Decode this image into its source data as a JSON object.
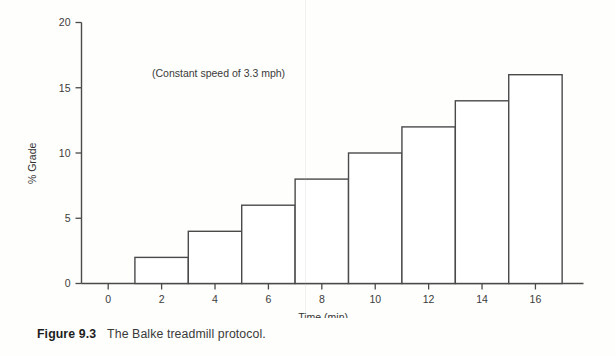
{
  "figure": {
    "caption_label": "Figure 9.3",
    "caption_text": "The Balke treadmill protocol."
  },
  "chart_data": {
    "type": "bar",
    "title": "",
    "subtitle": "",
    "annotation": "(Constant speed of 3.3 mph)",
    "xlabel": "Time (min)",
    "ylabel": "% Grade",
    "categories": [
      "2",
      "4",
      "6",
      "8",
      "10",
      "12",
      "14",
      "16"
    ],
    "x": [
      2,
      4,
      6,
      8,
      10,
      12,
      14,
      16
    ],
    "values": [
      2,
      4,
      6,
      8,
      10,
      12,
      14,
      16
    ],
    "bar_spans": [
      {
        "start": 1,
        "end": 3,
        "value": 2
      },
      {
        "start": 3,
        "end": 5,
        "value": 4
      },
      {
        "start": 5,
        "end": 7,
        "value": 6
      },
      {
        "start": 7,
        "end": 9,
        "value": 8
      },
      {
        "start": 9,
        "end": 11,
        "value": 10
      },
      {
        "start": 11,
        "end": 13,
        "value": 12
      },
      {
        "start": 13,
        "end": 15,
        "value": 14
      },
      {
        "start": 15,
        "end": 17,
        "value": 16
      }
    ],
    "xlim": [
      -1,
      17.8
    ],
    "ylim": [
      0,
      20
    ],
    "xticks": [
      0,
      2,
      4,
      6,
      8,
      10,
      12,
      14,
      16
    ],
    "xtick_labels": [
      "0",
      "2",
      "4",
      "6",
      "8",
      "10",
      "12",
      "14",
      "16"
    ],
    "yticks": [
      0,
      5,
      10,
      15,
      20
    ],
    "ytick_labels": [
      "0",
      "5",
      "10",
      "15",
      "20"
    ],
    "grid": false,
    "legend": false,
    "bar_fill": "#ffffff",
    "bar_stroke": "#4a4a4a",
    "axis_color": "#4a4a4a"
  }
}
